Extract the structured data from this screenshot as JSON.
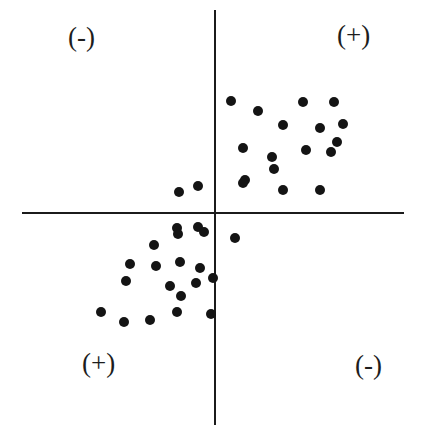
{
  "figure": {
    "width": 425,
    "height": 432,
    "background": "#ffffff",
    "point_color": "#141414",
    "axis_color": "#1b1b1b",
    "label_color": "#1d1d1d"
  },
  "axes": {
    "x_axis": {
      "x1": 22,
      "x2": 404,
      "y": 212,
      "thickness": 2
    },
    "y_axis": {
      "y1": 10,
      "y2": 425,
      "x": 214,
      "thickness": 2
    },
    "origin": {
      "x": 215,
      "y": 213
    }
  },
  "labels": {
    "top_left": "(-)",
    "top_right": "(+)",
    "bottom_left": "(+)",
    "bottom_right": "(-)"
  },
  "label_positions": {
    "top_left": {
      "left": 68,
      "top": 24
    },
    "top_right": {
      "left": 337,
      "top": 22
    },
    "bottom_left": {
      "left": 82,
      "top": 350
    },
    "bottom_right": {
      "left": 355,
      "top": 352
    }
  },
  "chart_data": {
    "type": "scatter",
    "title": "",
    "xlabel": "",
    "ylabel": "",
    "grid": false,
    "legend_position": "none",
    "annotations": [
      {
        "text": "(-)",
        "quadrant": "upper-left"
      },
      {
        "text": "(+)",
        "quadrant": "upper-right"
      },
      {
        "text": "(+)",
        "quadrant": "lower-left"
      },
      {
        "text": "(-)",
        "quadrant": "lower-right"
      }
    ],
    "axis_ranges": {
      "xlim": [
        -193,
        189
      ],
      "ylim": [
        -212,
        203
      ]
    },
    "point_diameter": 10,
    "series": [
      {
        "name": "upper-right cluster",
        "quadrant": "upper-right",
        "count": 18,
        "points": [
          [
            231,
            101
          ],
          [
            258,
            111
          ],
          [
            303,
            102
          ],
          [
            334,
            102
          ],
          [
            283,
            125
          ],
          [
            320,
            128
          ],
          [
            343,
            124
          ],
          [
            337,
            142
          ],
          [
            243,
            148
          ],
          [
            331,
            152
          ],
          [
            306,
            150
          ],
          [
            272,
            157
          ],
          [
            274,
            169
          ],
          [
            245,
            180
          ],
          [
            283,
            190
          ],
          [
            320,
            190
          ],
          [
            198,
            186
          ],
          [
            243,
            183
          ]
        ]
      },
      {
        "name": "lower-left cluster",
        "quadrant": "lower-left",
        "count": 20,
        "points": [
          [
            178,
            234
          ],
          [
            204,
            232
          ],
          [
            154,
            245
          ],
          [
            130,
            264
          ],
          [
            156,
            266
          ],
          [
            180,
            262
          ],
          [
            200,
            268
          ],
          [
            126,
            281
          ],
          [
            170,
            286
          ],
          [
            196,
            283
          ],
          [
            213,
            278
          ],
          [
            181,
            296
          ],
          [
            101,
            312
          ],
          [
            124,
            322
          ],
          [
            150,
            320
          ],
          [
            177,
            312
          ],
          [
            211,
            314
          ],
          [
            177,
            228
          ],
          [
            198,
            227
          ],
          [
            235,
            238
          ]
        ]
      }
    ],
    "points_all": [
      [
        231,
        101
      ],
      [
        258,
        111
      ],
      [
        303,
        102
      ],
      [
        334,
        102
      ],
      [
        283,
        125
      ],
      [
        320,
        128
      ],
      [
        343,
        124
      ],
      [
        337,
        142
      ],
      [
        243,
        148
      ],
      [
        331,
        152
      ],
      [
        306,
        150
      ],
      [
        272,
        157
      ],
      [
        274,
        169
      ],
      [
        245,
        180
      ],
      [
        283,
        190
      ],
      [
        320,
        190
      ],
      [
        179,
        192
      ],
      [
        198,
        186
      ],
      [
        243,
        183
      ],
      [
        177,
        228
      ],
      [
        198,
        227
      ],
      [
        235,
        238
      ],
      [
        178,
        234
      ],
      [
        204,
        232
      ],
      [
        154,
        245
      ],
      [
        130,
        264
      ],
      [
        156,
        266
      ],
      [
        180,
        262
      ],
      [
        200,
        268
      ],
      [
        126,
        281
      ],
      [
        170,
        286
      ],
      [
        196,
        283
      ],
      [
        213,
        278
      ],
      [
        181,
        296
      ],
      [
        101,
        312
      ],
      [
        124,
        322
      ],
      [
        150,
        320
      ],
      [
        177,
        312
      ],
      [
        211,
        314
      ]
    ]
  }
}
